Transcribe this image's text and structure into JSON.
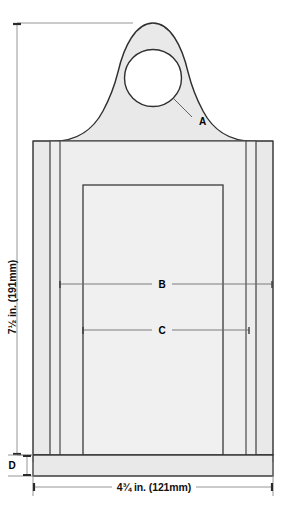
{
  "diagram": {
    "colors": {
      "outline": "#2f2f2f",
      "inner_line": "#4a4a4a",
      "body_fill": "#e9e9e9",
      "panel_fill": "#ededed",
      "inner_fill": "#f0f0f0",
      "hole_fill": "#ffffff",
      "dimension_line": "#6e6e6e",
      "label_text": "#111111",
      "page_background": "#ffffff"
    },
    "dimensions": [
      {
        "id": "height",
        "label": "7½ in. (191mm)",
        "orientation": "vertical",
        "position": "left",
        "value_in": "7½",
        "value_mm": "191"
      },
      {
        "id": "width",
        "label": "4¾ in. (121mm)",
        "orientation": "horizontal",
        "position": "bottom",
        "value_in": "4¾",
        "value_mm": "121"
      }
    ],
    "callouts": [
      {
        "id": "A",
        "label": "A",
        "target": "hanging-hole",
        "leader": true
      },
      {
        "id": "B",
        "label": "B",
        "target": "outer-panel-width",
        "leader": true
      },
      {
        "id": "C",
        "label": "C",
        "target": "inner-panel-width",
        "leader": true
      },
      {
        "id": "D",
        "label": "D",
        "target": "base-strip-height",
        "leader": true
      }
    ]
  }
}
